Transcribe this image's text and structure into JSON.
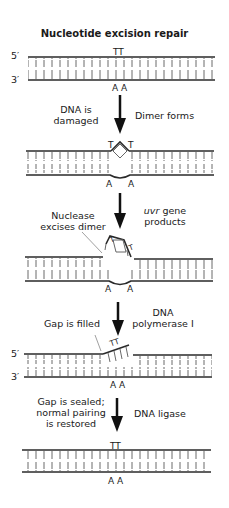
{
  "title": "Nucleotide excision repair",
  "strand_labels": {
    "five_prime": "5′",
    "three_prime": "3′"
  },
  "bases": {
    "top": "TT",
    "bottom": "A A",
    "t": "T",
    "a": "A"
  },
  "steps": [
    {
      "left_label": [
        "DNA is",
        "damaged"
      ],
      "right_label": [
        "Dimer forms"
      ]
    },
    {
      "left_label": [
        "Nuclease",
        "excises dimer"
      ],
      "right_label_italic": "uvr",
      "right_label": [
        " gene",
        "products"
      ]
    },
    {
      "left_label": [
        "Gap is filled"
      ],
      "right_label": [
        "DNA",
        "polymerase I"
      ]
    },
    {
      "left_label": [
        "Gap is sealed;",
        "normal pairing",
        "is restored"
      ],
      "right_label": [
        "DNA ligase"
      ]
    }
  ],
  "colors": {
    "strand": "#2a2a2a",
    "rung": "#6a6a6a",
    "arrow": "#111111"
  }
}
